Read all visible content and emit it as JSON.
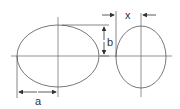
{
  "diagram": {
    "labels": {
      "a": "a",
      "b": "b",
      "x": "x"
    },
    "colors": {
      "line": "#555555",
      "text": "#333333",
      "background": "#ffffff"
    }
  }
}
